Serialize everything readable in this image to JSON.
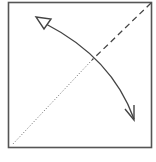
{
  "diagram": {
    "type": "origami-fold-step",
    "colors": {
      "background": "#ffffff",
      "stroke": "#444444",
      "paper_border": "#555555"
    },
    "square": {
      "x": 8.5,
      "y": 2.5,
      "width": 143,
      "height": 145
    },
    "valley_fold_line": {
      "x1": 151,
      "y1": 3,
      "x2": 92,
      "y2": 60,
      "style": "dashed"
    },
    "crease_line": {
      "x1": 92,
      "y1": 60,
      "x2": 12,
      "y2": 145,
      "style": "dotted"
    },
    "fold_arrow": {
      "path": "M 44 23 Q 112 60 134 119",
      "head_start": "hollow-triangle",
      "head_end": "open-v"
    }
  }
}
